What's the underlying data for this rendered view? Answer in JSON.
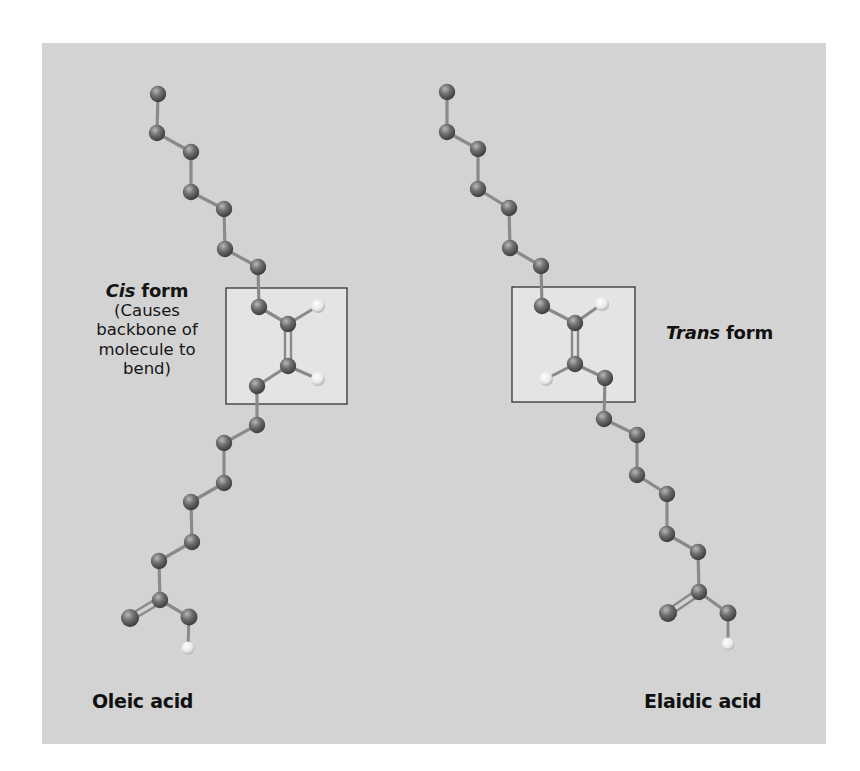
{
  "figure": {
    "background_color": "#d3d3d3",
    "highlight_box_color": "#e4e4e4",
    "atom_colors": {
      "carbon_oxygen": "#6e6e6e",
      "hydrogen": "#f0f0f0"
    }
  },
  "left": {
    "form_emphasis": "Cis",
    "form_suffix": " form",
    "description_lines": [
      "(Causes",
      "backbone of",
      "molecule to",
      "bend)"
    ],
    "name": "Oleic acid",
    "backbone": [
      [
        158,
        94
      ],
      [
        157,
        133
      ],
      [
        191,
        152
      ],
      [
        191,
        192
      ],
      [
        224,
        209
      ],
      [
        225,
        249
      ],
      [
        258,
        267
      ],
      [
        259,
        307
      ],
      [
        288,
        324
      ],
      [
        288,
        366
      ],
      [
        257,
        386
      ],
      [
        257,
        425
      ],
      [
        224,
        443
      ],
      [
        224,
        483
      ],
      [
        191,
        502
      ],
      [
        192,
        542
      ],
      [
        159,
        561
      ],
      [
        160,
        600
      ]
    ],
    "double_bond": [
      [
        288,
        324
      ],
      [
        288,
        366
      ]
    ],
    "double_bond_hydrogens": [
      [
        318,
        306
      ],
      [
        318,
        379
      ]
    ],
    "box": {
      "x": 226,
      "y": 288,
      "w": 121,
      "h": 116
    },
    "carboxyl": {
      "carbon": [
        160,
        600
      ],
      "o_double": [
        130,
        618
      ],
      "o_single": [
        189,
        617
      ],
      "h": [
        188,
        648
      ]
    }
  },
  "right": {
    "form_emphasis": "Trans",
    "form_suffix": " form",
    "name": "Elaidic acid",
    "backbone": [
      [
        447,
        92
      ],
      [
        447,
        132
      ],
      [
        478,
        149
      ],
      [
        478,
        189
      ],
      [
        509,
        208
      ],
      [
        510,
        248
      ],
      [
        541,
        266
      ],
      [
        542,
        306
      ],
      [
        575,
        323
      ],
      [
        575,
        364
      ],
      [
        605,
        378
      ],
      [
        604,
        419
      ],
      [
        637,
        435
      ],
      [
        637,
        475
      ],
      [
        667,
        494
      ],
      [
        667,
        534
      ],
      [
        698,
        552
      ],
      [
        699,
        592
      ]
    ],
    "double_bond": [
      [
        575,
        323
      ],
      [
        575,
        364
      ]
    ],
    "double_bond_hydrogens": [
      [
        602,
        304
      ],
      [
        546,
        379
      ]
    ],
    "box": {
      "x": 512,
      "y": 287,
      "w": 123,
      "h": 115
    },
    "carboxyl": {
      "carbon": [
        699,
        592
      ],
      "o_double": [
        668,
        613
      ],
      "o_single": [
        728,
        613
      ],
      "h": [
        728,
        644
      ]
    }
  }
}
